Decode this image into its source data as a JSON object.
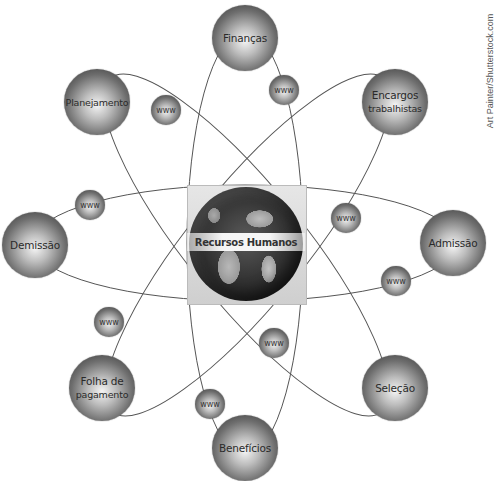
{
  "diagram": {
    "center": {
      "label": "Recursos Humanos",
      "icon": "globe-icon"
    },
    "nodes": [
      {
        "id": "financas",
        "label": "Finanças",
        "lines": [
          "Finanças"
        ]
      },
      {
        "id": "planejamento",
        "label": "Planejamento",
        "lines": [
          "Planejamento"
        ]
      },
      {
        "id": "encargos",
        "label": "Encargos trabalhistas",
        "lines": [
          "Encargos",
          "trabalhistas"
        ]
      },
      {
        "id": "demissao",
        "label": "Demissão",
        "lines": [
          "Demissão"
        ]
      },
      {
        "id": "admissao",
        "label": "Admissão",
        "lines": [
          "Admissão"
        ]
      },
      {
        "id": "folha",
        "label": "Folha de pagamento",
        "lines": [
          "Folha de",
          "pagamento"
        ]
      },
      {
        "id": "selecao",
        "label": "Seleção",
        "lines": [
          "Seleção"
        ]
      },
      {
        "id": "beneficios",
        "label": "Benefícios",
        "lines": [
          "Benefícios"
        ]
      }
    ],
    "satellites": [
      {
        "label": "www"
      },
      {
        "label": "www"
      },
      {
        "label": "www"
      },
      {
        "label": "www"
      },
      {
        "label": "www"
      },
      {
        "label": "www"
      },
      {
        "label": "www"
      },
      {
        "label": "www"
      }
    ],
    "orbits": [
      {
        "name": "horizontal",
        "connects": [
          "Demissão",
          "Admissão"
        ]
      },
      {
        "name": "vertical",
        "connects": [
          "Finanças",
          "Benefícios"
        ]
      },
      {
        "name": "diagonal-down",
        "connects": [
          "Planejamento",
          "Seleção"
        ]
      },
      {
        "name": "diagonal-up",
        "connects": [
          "Encargos trabalhistas",
          "Folha de pagamento"
        ]
      }
    ]
  },
  "credit": "Art Painter/Shutterstock.com",
  "colors": {
    "background": "#ffffff",
    "orbit_line": "#555555",
    "node_dark": "#2e2e2e",
    "node_light": "#f4f4f4"
  }
}
